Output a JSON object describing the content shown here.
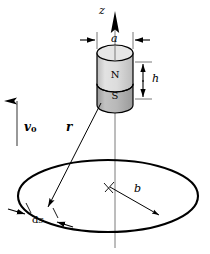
{
  "figure": {
    "colors": {
      "line": "#000000",
      "axis": "#6e6e6e",
      "magnet_north_fill": "#d8d8d8",
      "magnet_south_fill": "#a8a8a8",
      "magnet_top_fill": "#e4e4e4",
      "background": "#ffffff"
    }
  },
  "labels": {
    "z_axis": "z",
    "diameter": "a",
    "height": "h",
    "radius": "b",
    "position_vector": "r",
    "velocity": "v",
    "velocity_subscript": "0",
    "arc_element_d": "d",
    "arc_element_s": "s",
    "north_pole": "N",
    "south_pole": "S"
  },
  "geometry": {
    "axis_x": 115,
    "axis_top_y": 12,
    "axis_bottom_y": 248,
    "magnet": {
      "left_x": 97,
      "right_x": 133,
      "top_y": 53,
      "bottom_y": 105,
      "ellipse_ry": 8,
      "divider_y": 84
    },
    "loop": {
      "cx": 108,
      "cy": 196,
      "rx": 90,
      "ry": 36
    },
    "dim_a_y": 40,
    "dim_h": {
      "x": 143,
      "top_y": 62,
      "bottom_y": 99
    },
    "r_vector": {
      "x1": 101,
      "y1": 104,
      "x2": 48,
      "y2": 209
    },
    "b_vector": {
      "x1": 110,
      "y1": 187,
      "x2": 161,
      "y2": 216
    },
    "v0_arrow": {
      "x": 17,
      "top_y": 100,
      "bottom_y": 146
    }
  }
}
